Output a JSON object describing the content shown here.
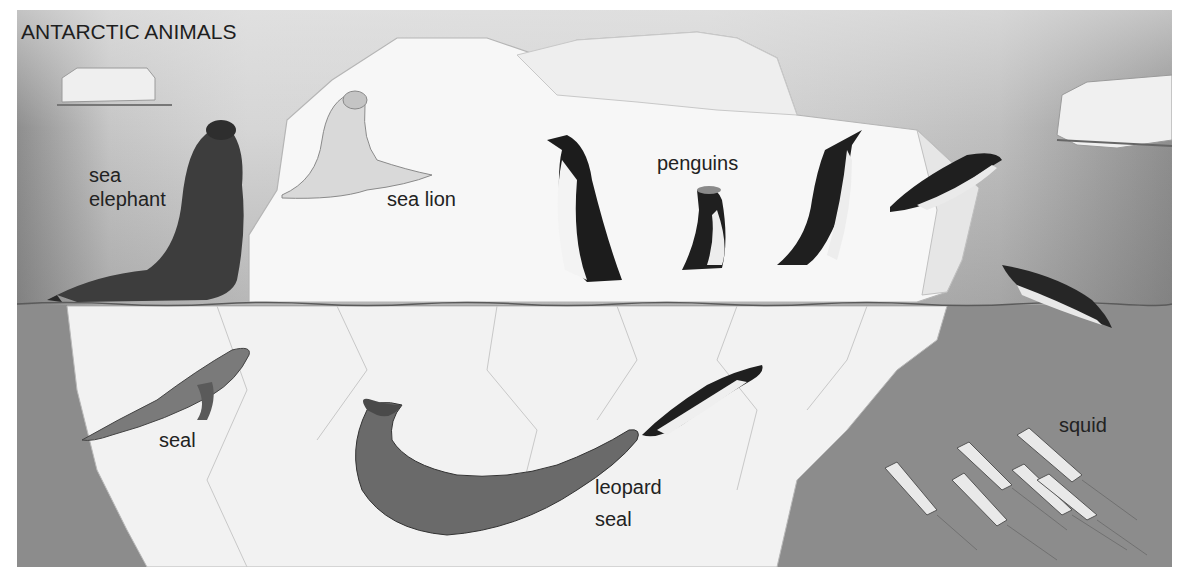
{
  "title": "ANTARCTIC ANIMALS",
  "labels": {
    "sea_elephant_line1": "sea",
    "sea_elephant_line2": "elephant",
    "sea_lion": "sea lion",
    "penguins": "penguins",
    "seal": "seal",
    "leopard_seal_line1": "leopard",
    "leopard_seal_line2": "seal",
    "squid": "squid"
  },
  "colors": {
    "sky": "#d4d4d4",
    "water": "#8c8c8c",
    "ice": "#f6f6f6",
    "ink": "#222222"
  }
}
